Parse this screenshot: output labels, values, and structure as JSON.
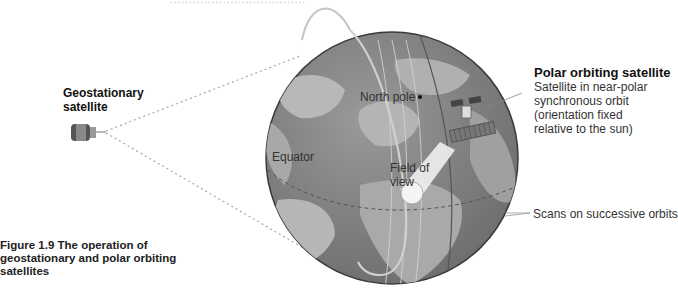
{
  "figure": {
    "caption_number": "Figure 1.9",
    "caption_text": "The operation of geostationary and polar orbiting satellites",
    "caption_lines": [
      "Figure 1.9  The operation of",
      "geostationary and polar orbiting",
      "satellites"
    ],
    "cut_off_top_text": "...................................."
  },
  "labels": {
    "geostationary_title_lines": [
      "Geostationary",
      "satellite"
    ],
    "polar_title": "Polar orbiting satellite",
    "polar_desc_lines": [
      "Satellite in near-polar",
      "synchronous orbit",
      "(orientation fixed",
      "relative to the sun)"
    ],
    "north_pole": "North pole",
    "equator": "Equator",
    "field_of_view_lines": [
      "Field of",
      "view"
    ],
    "scans": "Scans on successive orbits"
  },
  "colors": {
    "globe_ocean": "#7d7d7d",
    "globe_land": "#b4b4b4",
    "globe_outline": "#444444",
    "orbit_ring": "#c8c8c8",
    "dotted_lines": "#a0a0a0",
    "text": "#222222"
  },
  "icons": {
    "geostationary": "satellite-drum-icon",
    "polar": "satellite-solar-panel-icon"
  }
}
